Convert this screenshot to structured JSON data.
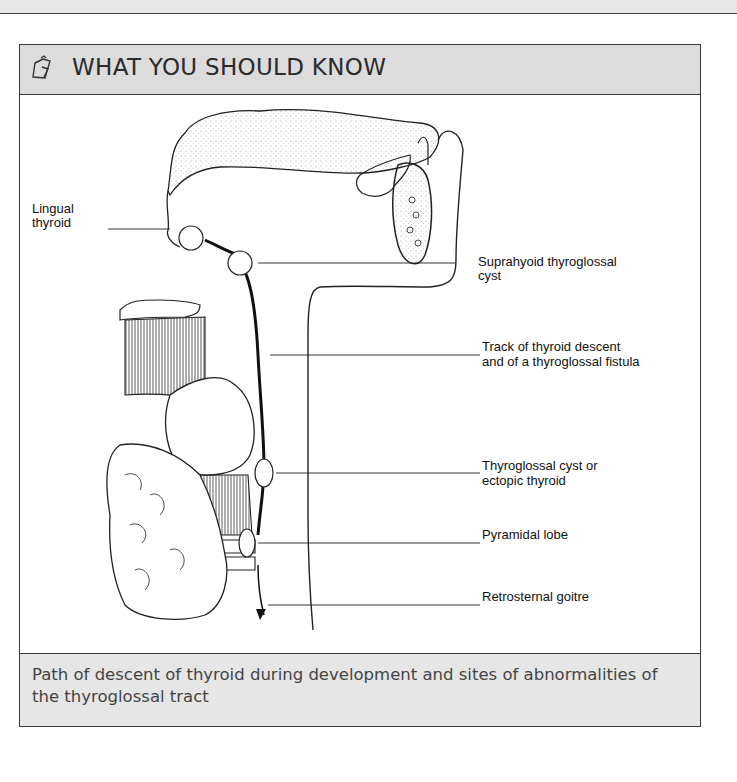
{
  "page_header": {
    "text": ""
  },
  "panel": {
    "title": "WHAT YOU SHOULD KNOW",
    "icon": "clipboard-pencil-icon",
    "caption": "Path of descent of thyroid during development and sites of abnormalities of the thyroglossal tract"
  },
  "diagram": {
    "labels": {
      "lingual_thyroid_1": "Lingual",
      "lingual_thyroid_2": "thyroid",
      "suprahyoid_1": "Suprahyoid thyroglossal",
      "suprahyoid_2": "cyst",
      "track_1": "Track of thyroid descent",
      "track_2": "and of a thyroglossal fistula",
      "cyst_1": "Thyroglossal cyst or",
      "cyst_2": "ectopic thyroid",
      "pyramidal": "Pyramidal lobe",
      "retrosternal": "Retrosternal goitre"
    }
  }
}
